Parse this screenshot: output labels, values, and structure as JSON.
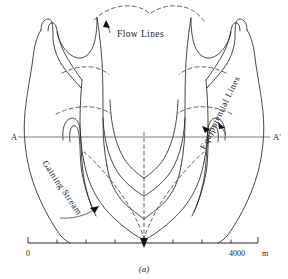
{
  "figure": {
    "label": "(a)",
    "type": "groundwater-flow-net-map-view"
  },
  "labels": {
    "flow_lines": "Flow Lines",
    "equipotential_lines": "Equipotential Lines",
    "gaining_stream": "Gaining Stream",
    "section_left": "A",
    "section_right": "A'"
  },
  "scale": {
    "min_label": "0",
    "max_label": "4000",
    "unit": "m",
    "min_value": 0,
    "max_value": 4000,
    "tick_count": 8
  },
  "legend_semantics": {
    "solid": "Equipotential Lines",
    "dashed": "Flow Lines",
    "arrowhead": "stream flow direction"
  },
  "colors": {
    "background": "#ffffff",
    "line": "#262626",
    "dashed": "#3a3a3a",
    "section": "#555555",
    "text": "#1a1a1a"
  }
}
